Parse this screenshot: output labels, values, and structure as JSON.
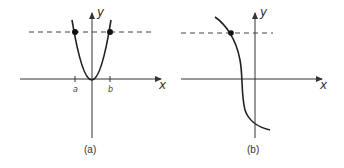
{
  "panels": [
    {
      "id": "a",
      "caption": "(a)",
      "x_axis_label": "x",
      "y_axis_label": "y",
      "tick_labels": [
        "a",
        "b"
      ],
      "description": "Parabola y = x^2 intersected by horizontal dashed line at two points (a and b)",
      "intersection_points": 2
    },
    {
      "id": "b",
      "caption": "(b)",
      "x_axis_label": "x",
      "y_axis_label": "y",
      "tick_labels": [],
      "description": "Monotonically decreasing curve intersected by horizontal dashed line at one point",
      "intersection_points": 1
    }
  ],
  "colors": {
    "curve": "#222222",
    "axis": "#333333",
    "background": "#ffffff"
  }
}
